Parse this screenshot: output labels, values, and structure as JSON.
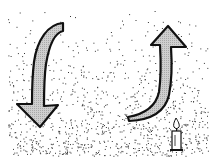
{
  "illustration": {
    "description": "Stippled black-and-white drawing with a curved arrow pointing down on the left, a curved arrow pointing up on the right, and a small lit candle at the lower right",
    "colors": {
      "background": "#ffffff",
      "ink": "#111111",
      "arrow_fill": "#c8c8c8",
      "stipple": "#333333"
    },
    "elements": [
      {
        "name": "down-arrow",
        "direction": "down",
        "position": "left"
      },
      {
        "name": "up-arrow",
        "direction": "up",
        "position": "right"
      },
      {
        "name": "candle",
        "state": "lit",
        "position": "bottom-right"
      }
    ]
  }
}
